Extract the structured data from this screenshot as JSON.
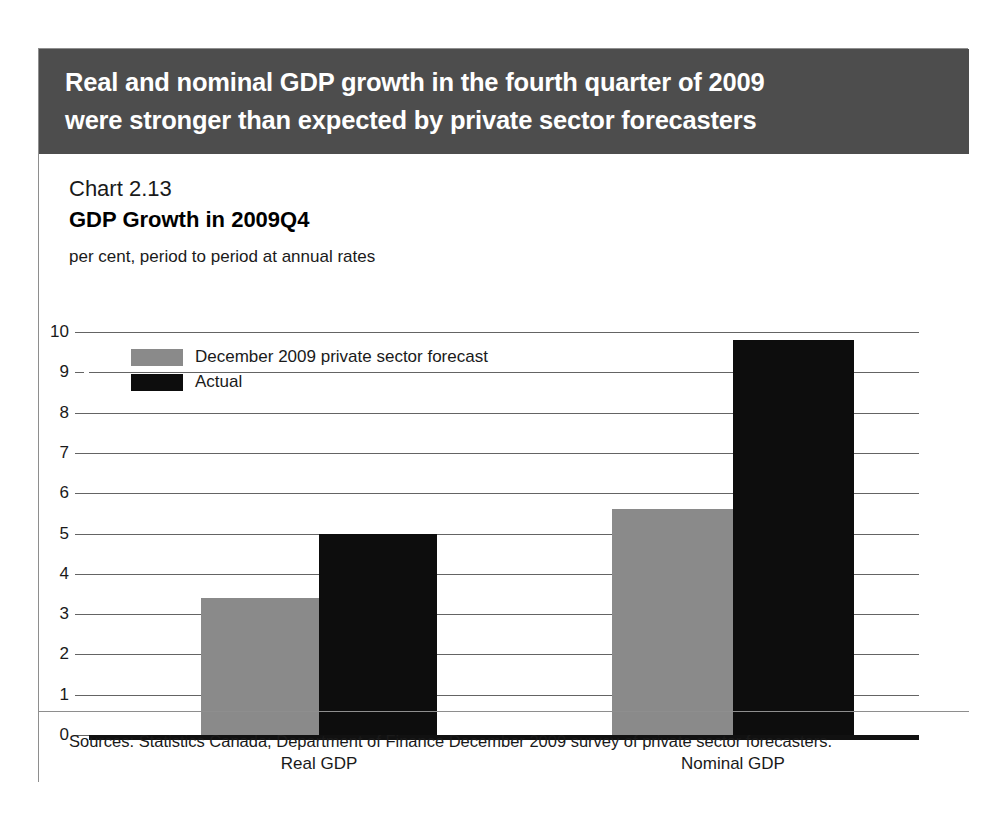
{
  "header": {
    "line1": "Real and nominal GDP growth in the fourth quarter of 2009",
    "line2": "were stronger than expected by private sector forecasters",
    "background_color": "#4d4d4d",
    "text_color": "#ffffff"
  },
  "chart": {
    "number": "Chart 2.13",
    "title": "GDP Growth in 2009Q4",
    "units": "per cent, period to period at annual rates",
    "source": "Sources: Statistics Canada; Department of Finance December 2009 survey of private sector forecasters."
  },
  "chart_data": {
    "type": "bar",
    "title": "GDP Growth in 2009Q4",
    "subtitle": "Chart 2.13",
    "xlabel": "",
    "ylabel": "per cent, period to period at annual rates",
    "ylim": [
      0,
      10
    ],
    "ytick_step": 1,
    "yticks": [
      0,
      1,
      2,
      3,
      4,
      5,
      6,
      7,
      8,
      9,
      10
    ],
    "ytick_labels": [
      "0",
      "1",
      "2",
      "3",
      "4",
      "5",
      "6",
      "7",
      "8",
      "9",
      "10"
    ],
    "grid": true,
    "grid_axis": "y",
    "legend_position": "upper-left-inside",
    "categories": [
      "Real GDP",
      "Nominal GDP"
    ],
    "series": [
      {
        "name": "December 2009 private sector forecast",
        "color": "#8a8a8a",
        "values": [
          3.4,
          5.6
        ]
      },
      {
        "name": "Actual",
        "color": "#0d0d0d",
        "values": [
          5.0,
          9.8
        ]
      }
    ]
  }
}
